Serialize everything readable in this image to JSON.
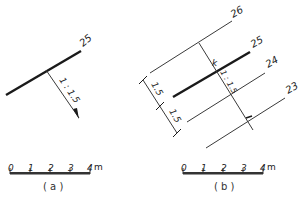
{
  "panel_a": {
    "caption": "( a )",
    "contour_label": "25",
    "slope_label": "1 : 1.5",
    "scale_bar": {
      "ticks": [
        "0",
        "1",
        "2",
        "3",
        "4"
      ],
      "unit": "m"
    }
  },
  "panel_b": {
    "caption": "( b )",
    "contour_labels": [
      "26",
      "25",
      "24",
      "23"
    ],
    "point_label": "k",
    "slope_label": "1 : 1.5",
    "spacing_labels": [
      "1.5",
      "1.5"
    ],
    "scale_bar": {
      "ticks": [
        "0",
        "1",
        "2",
        "3",
        "4"
      ],
      "unit": "m"
    }
  },
  "colors": {
    "line": "#1a1a1a",
    "thin": "#3a3a3a"
  }
}
